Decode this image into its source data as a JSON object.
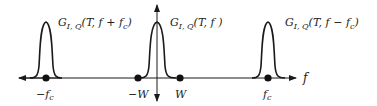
{
  "diagram": {
    "type": "frequency-spectrum",
    "axis": {
      "label": "f"
    },
    "colors": {
      "stroke": "#1a1a1a",
      "text": "#222222",
      "background": "#ffffff"
    },
    "pulses": [
      {
        "id": "left",
        "label_main": "G",
        "label_sub": "I, Q",
        "label_args": "(T, f + f",
        "label_args_sub": "c",
        "label_close": ")"
      },
      {
        "id": "center",
        "label_main": "G",
        "label_sub": "I, Q",
        "label_args": "(T, f )",
        "label_args_sub": "",
        "label_close": ""
      },
      {
        "id": "right",
        "label_main": "G",
        "label_sub": "I, Q",
        "label_args": "(T, f − f",
        "label_args_sub": "c",
        "label_close": ")"
      }
    ],
    "tick_labels": [
      {
        "id": "neg-fc",
        "main": "−f",
        "sub": "c"
      },
      {
        "id": "neg-w",
        "main": "−W",
        "sub": ""
      },
      {
        "id": "pos-w",
        "main": "W",
        "sub": ""
      },
      {
        "id": "pos-fc",
        "main": "f",
        "sub": "c"
      }
    ]
  }
}
